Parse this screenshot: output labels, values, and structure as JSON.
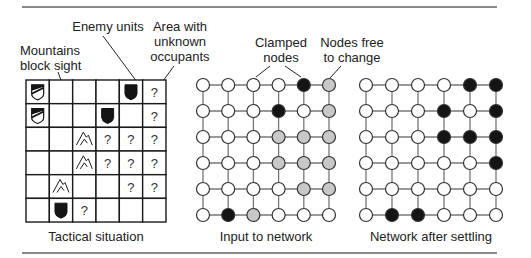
{
  "labels": {
    "enemy_units": "Enemy units",
    "unknown_area_1": "Area with",
    "unknown_area_2": "unknown",
    "unknown_area_3": "occupants",
    "mountains_1": "Mountains",
    "mountains_2": "block sight",
    "clamped_1": "Clamped",
    "clamped_2": "nodes",
    "free_1": "Nodes free",
    "free_2": "to change"
  },
  "captions": {
    "tactical": "Tactical situation",
    "input": "Input to network",
    "settled": "Network after settling"
  },
  "colors": {
    "black": "#141414",
    "gray": "#c8c8c8",
    "white": "#ffffff",
    "line": "#777777",
    "grid": "#1a1a1a"
  },
  "icon_legend": {
    "F": "friendly-unit-icon",
    "E": "enemy-unit-icon",
    "M": "mountain-icon",
    "?": "unknown-marker",
    "": "empty"
  },
  "tactical_grid": [
    [
      "F",
      "",
      "",
      "",
      "E",
      "?"
    ],
    [
      "F",
      "",
      "",
      "E",
      "",
      "?"
    ],
    [
      "",
      "",
      "M",
      "?",
      "?",
      "?"
    ],
    [
      "",
      "",
      "M",
      "?",
      "?",
      "?"
    ],
    [
      "",
      "M",
      "",
      "",
      "?",
      "?"
    ],
    [
      "",
      "E",
      "?",
      "",
      "",
      ""
    ]
  ],
  "input_network": [
    [
      "W",
      "W",
      "W",
      "W",
      "B",
      "G"
    ],
    [
      "W",
      "W",
      "W",
      "B",
      "W",
      "G"
    ],
    [
      "W",
      "W",
      "W",
      "G",
      "G",
      "G"
    ],
    [
      "W",
      "W",
      "W",
      "G",
      "G",
      "G"
    ],
    [
      "W",
      "W",
      "W",
      "W",
      "G",
      "G"
    ],
    [
      "W",
      "B",
      "G",
      "W",
      "W",
      "W"
    ]
  ],
  "settled_network": [
    [
      "W",
      "W",
      "W",
      "W",
      "B",
      "B"
    ],
    [
      "W",
      "W",
      "W",
      "B",
      "W",
      "B"
    ],
    [
      "W",
      "W",
      "W",
      "B",
      "B",
      "B"
    ],
    [
      "W",
      "W",
      "W",
      "W",
      "W",
      "B"
    ],
    [
      "W",
      "W",
      "W",
      "W",
      "W",
      "W"
    ],
    [
      "W",
      "B",
      "B",
      "W",
      "W",
      "W"
    ]
  ],
  "node_state_legend": {
    "W": "off / white",
    "B": "on / black",
    "G": "free / gray"
  }
}
